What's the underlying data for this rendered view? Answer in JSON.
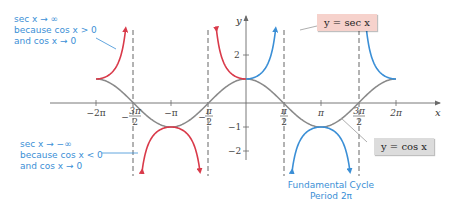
{
  "chart_data": {
    "type": "line",
    "title": "",
    "xlabel": "x",
    "ylabel": "y",
    "xlim": [
      -6.8,
      6.8
    ],
    "ylim": [
      -2.6,
      3.6
    ],
    "grid": false,
    "x_tick_labels": [
      "-2π",
      "-3π/2",
      "-π",
      "-π/2",
      "π/2",
      "π",
      "3π/2",
      "2π"
    ],
    "x_tick_values": [
      -6.2832,
      -4.7124,
      -3.1416,
      -1.5708,
      1.5708,
      3.1416,
      4.7124,
      6.2832
    ],
    "y_tick_labels": [
      "2",
      "1",
      "-1",
      "-2"
    ],
    "y_tick_values": [
      2,
      1,
      -1,
      -2
    ],
    "vertical_asymptotes": [
      -4.7124,
      -1.5708,
      1.5708,
      4.7124
    ],
    "series": [
      {
        "name": "y = cos x",
        "function": "cos(x)",
        "domain": [
          -6.2832,
          6.2832
        ],
        "color": "#8a8a8a"
      },
      {
        "name": "y = sec x (outside fundamental cycle)",
        "function": "sec(x)",
        "color": "#d93a4a",
        "branches": [
          [
            -6.2832,
            -4.7124
          ],
          [
            -4.7124,
            -1.5708
          ],
          [
            -1.5708,
            0
          ]
        ]
      },
      {
        "name": "y = sec x (fundamental cycle)",
        "function": "sec(x)",
        "color": "#3b8fd6",
        "branches": [
          [
            0,
            1.5708
          ],
          [
            1.5708,
            4.7124
          ],
          [
            4.7124,
            6.2832
          ]
        ]
      }
    ],
    "key_points": [
      {
        "x": -6.2832,
        "y": 1
      },
      {
        "x": -3.1416,
        "y": -1
      },
      {
        "x": 0,
        "y": 1
      },
      {
        "x": 3.1416,
        "y": -1
      },
      {
        "x": 6.2832,
        "y": 1
      }
    ],
    "legend": [
      "y = sec x",
      "y = cos x"
    ],
    "annotations": [
      "sec x → ∞ because cos x > 0 and cos x → 0",
      "sec x → −∞ because cos x < 0 and cos x → 0",
      "Fundamental Cycle Period 2π"
    ]
  },
  "labels": {
    "x_axis": "x",
    "y_axis": "y",
    "x_ticks": {
      "neg_2pi": "−2π",
      "neg_3pi_2_num": "3π",
      "neg_pi": "−π",
      "neg_pi_2_num": "π",
      "pi_2_num": "π",
      "pi": "π",
      "3pi_2_num": "3π",
      "2pi": "2π",
      "den": "2",
      "minus": "−"
    },
    "y_ticks": {
      "two": "2",
      "neg_one": "−1",
      "neg_two": "−2"
    }
  },
  "callouts": {
    "sec_box": "y = sec x",
    "cos_box": "y = cos x",
    "pos_inf": {
      "line1": "sec x → ∞",
      "line2": "because cos x > 0",
      "line3": "and cos x → 0"
    },
    "neg_inf": {
      "line1": "sec x → −∞",
      "line2": "because cos x < 0",
      "line3": "and cos x → 0"
    },
    "cycle": {
      "line1": "Fundamental Cycle",
      "line2": "Period 2π"
    }
  },
  "colors": {
    "red": "#d93a4a",
    "blue": "#3b8fd6",
    "gray": "#8a8a8a",
    "axis": "#6a6a6a"
  }
}
